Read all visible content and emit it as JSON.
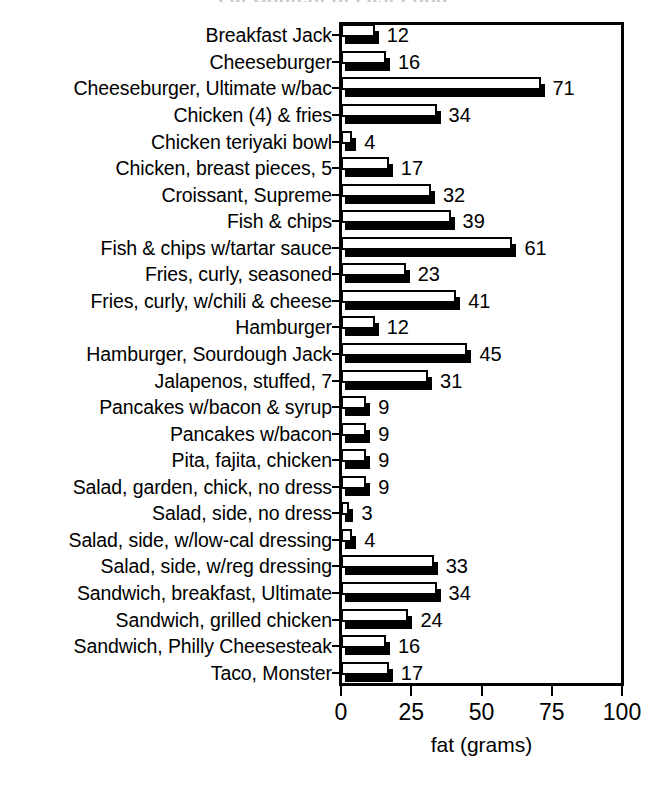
{
  "chart_data": {
    "type": "bar",
    "orientation": "horizontal",
    "title": "Fat Content of Fast Food",
    "xlabel": "fat (grams)",
    "ylabel": "",
    "xlim": [
      0,
      100
    ],
    "xticks": [
      0,
      25,
      50,
      75,
      100
    ],
    "xtick_labels": [
      "0",
      "25",
      "50",
      "75",
      "100"
    ],
    "grid": false,
    "legend": false,
    "show_value_labels": true,
    "categories": [
      "Breakfast Jack",
      "Cheeseburger",
      "Cheeseburger, Ultimate w/bac",
      "Chicken (4) & fries",
      "Chicken teriyaki bowl",
      "Chicken, breast pieces, 5",
      "Croissant, Supreme",
      "Fish & chips",
      "Fish & chips w/tartar sauce",
      "Fries, curly, seasoned",
      "Fries, curly, w/chili & cheese",
      "Hamburger",
      "Hamburger, Sourdough Jack",
      "Jalapenos, stuffed, 7",
      "Pancakes w/bacon & syrup",
      "Pancakes w/bacon",
      "Pita, fajita, chicken",
      "Salad, garden, chick, no dress",
      "Salad, side, no dress",
      "Salad, side, w/low-cal dressing",
      "Salad, side, w/reg dressing",
      "Sandwich, breakfast, Ultimate",
      "Sandwich, grilled chicken",
      "Sandwich, Philly Cheesesteak",
      "Taco, Monster"
    ],
    "values": [
      12,
      16,
      71,
      34,
      4,
      17,
      32,
      39,
      61,
      23,
      41,
      12,
      45,
      31,
      9,
      9,
      9,
      9,
      3,
      4,
      33,
      34,
      24,
      16,
      17
    ],
    "value_labels": [
      "12",
      "16",
      "71",
      "34",
      "4",
      "17",
      "32",
      "39",
      "61",
      "23",
      "41",
      "12",
      "45",
      "31",
      "9",
      "9",
      "9",
      "9",
      "3",
      "4",
      "33",
      "34",
      "24",
      "16",
      "17"
    ],
    "colors": {
      "bar_face": "#ffffff",
      "bar_outline": "#000000",
      "bar_shadow": "#000000",
      "axis": "#000000",
      "text": "#000000",
      "background": "#ffffff"
    }
  }
}
